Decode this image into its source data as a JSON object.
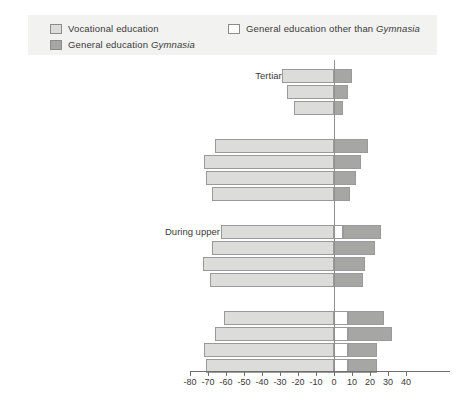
{
  "legend": {
    "items": [
      {
        "key": "vocational",
        "label": "Vocational education",
        "color": "#dcdcda"
      },
      {
        "key": "gymnasia",
        "label": "General education Gymnasia",
        "color": "#a6a6a4"
      },
      {
        "key": "other",
        "label": "General  education other than Gymnasia",
        "color": "#ffffff"
      }
    ]
  },
  "axis": {
    "ticks": [
      "-80",
      "-70",
      "-60",
      "-50",
      "-40",
      "-30",
      "-20",
      "-10",
      "0",
      "10",
      "20",
      "30",
      "40"
    ],
    "tick_values": [
      -80,
      -70,
      -60,
      -50,
      -40,
      -30,
      -20,
      -10,
      0,
      10,
      20,
      30,
      40
    ],
    "xlim": [
      -80,
      40
    ],
    "zero_label": "0"
  },
  "chart_data": {
    "type": "bar",
    "orientation": "horizontal",
    "stacked": true,
    "diverging": true,
    "title": "",
    "xlabel": "",
    "ylabel": "",
    "xlim": [
      -80,
      40
    ],
    "grid": false,
    "legend_position": "top",
    "series": [
      {
        "name": "Vocational education",
        "color": "#dcdcda"
      },
      {
        "name": "General  education other than Gymnasia",
        "color": "#ffffff"
      },
      {
        "name": "General education Gymnasia",
        "color": "#a6a6a4"
      }
    ],
    "groups": [
      {
        "name": "Tertiary entry",
        "label": "Tertiary entry",
        "rows": [
          {
            "year": "1993",
            "vocational": -29,
            "other": 0,
            "gymnasia": 10
          },
          {
            "year": "1990",
            "vocational": -26,
            "other": 0,
            "gymnasia": 8
          },
          {
            "year": "1987",
            "vocational": -22,
            "other": 0,
            "gymnasia": 5
          }
        ]
      },
      {
        "name": "Graduation",
        "label": "Graduation",
        "rows": [
          {
            "year": "1993",
            "vocational": -66,
            "other": 0,
            "gymnasia": 19
          },
          {
            "year": "1990",
            "vocational": -72,
            "other": 0,
            "gymnasia": 15
          },
          {
            "year": "1985",
            "vocational": -71,
            "other": 0,
            "gymnasia": 12
          },
          {
            "year": "1980",
            "vocational": -68,
            "other": 0,
            "gymnasia": 9
          }
        ]
      },
      {
        "name": "During upper secondary education",
        "label": "During upper secondary education",
        "rows": [
          {
            "year": "1993",
            "vocational": -63,
            "other": 5,
            "gymnasia": 21
          },
          {
            "year": "1990",
            "vocational": -68,
            "other": 0,
            "gymnasia": 23
          },
          {
            "year": "1985",
            "vocational": -73,
            "other": 0,
            "gymnasia": 17
          },
          {
            "year": "1980",
            "vocational": -69,
            "other": 0,
            "gymnasia": 16
          }
        ]
      },
      {
        "name": "First entry",
        "label": "First entry",
        "rows": [
          {
            "year": "1993",
            "vocational": -61,
            "other": 8,
            "gymnasia": 20
          },
          {
            "year": "1990",
            "vocational": -66,
            "other": 8,
            "gymnasia": 24
          },
          {
            "year": "1985",
            "vocational": -72,
            "other": 8,
            "gymnasia": 16
          },
          {
            "year": "1980",
            "vocational": -71,
            "other": 8,
            "gymnasia": 16
          }
        ]
      }
    ]
  }
}
